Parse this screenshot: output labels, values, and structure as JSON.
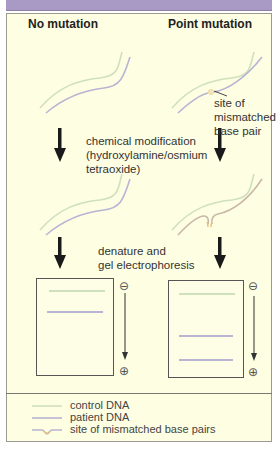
{
  "headers": {
    "left": "No mutation",
    "right": "Point mutation"
  },
  "annotations": {
    "mismatch_site": [
      "site of",
      "mismatched",
      "base pair"
    ],
    "step1": [
      "chemical modification",
      "(hydroxylamine/osmium",
      "tetraoxide)"
    ],
    "step2": [
      "denature and",
      "gel electrophoresis"
    ]
  },
  "electrodes": {
    "negative": "⊖",
    "positive": "⊕"
  },
  "gels": {
    "left": {
      "bands": [
        {
          "type": "control",
          "y_pct": 12
        },
        {
          "type": "patient",
          "y_pct": 32
        }
      ]
    },
    "right": {
      "bands": [
        {
          "type": "control",
          "y_pct": 12
        },
        {
          "type": "patient",
          "y_pct": 63
        },
        {
          "type": "patient",
          "y_pct": 88
        }
      ]
    }
  },
  "legend": {
    "items": [
      {
        "label": "control DNA",
        "symbol": "line",
        "color": "#cfe0bc"
      },
      {
        "label": "patient DNA",
        "symbol": "line",
        "color": "#b8b4d4"
      },
      {
        "label": "site of mismatched base pairs",
        "symbol": "bulge",
        "color": "#e8d29a"
      }
    ]
  },
  "colors": {
    "header_bar": "#a89ac4",
    "panel_bg": "#fefee2",
    "control_dna": "#cfe0bc",
    "patient_dna": "#b8b4d4",
    "mismatch": "#e8d29a",
    "arrow": "#1a1a1a"
  }
}
